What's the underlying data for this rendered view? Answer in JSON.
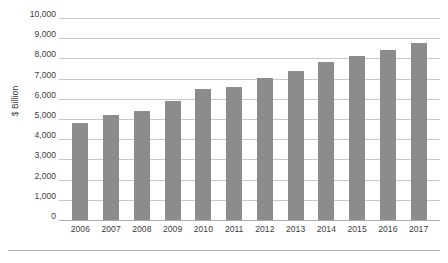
{
  "chart_data": {
    "type": "bar",
    "title": "",
    "xlabel": "",
    "ylabel": "$ Billion",
    "categories": [
      "2006",
      "2007",
      "2008",
      "2009",
      "2010",
      "2011",
      "2012",
      "2013",
      "2014",
      "2015",
      "2016",
      "2017"
    ],
    "values": [
      4800,
      5200,
      5400,
      5900,
      6500,
      6600,
      7050,
      7400,
      7800,
      8100,
      8400,
      8750
    ],
    "ylim": [
      0,
      10000
    ],
    "y_ticks": [
      0,
      1000,
      2000,
      3000,
      4000,
      5000,
      6000,
      7000,
      8000,
      9000,
      10000
    ],
    "y_tick_labels": [
      "0",
      "1,000",
      "2,000",
      "3,000",
      "4,000",
      "5,000",
      "6,000",
      "7,000",
      "8,000",
      "9,000",
      "10,000"
    ],
    "grid": true,
    "legend": false,
    "bar_color": "#8c8c8c",
    "gridline_color": "#c9c9c9",
    "axis_color": "#a8a8a8",
    "background_color": "#ffffff"
  },
  "caption": {
    "text": ""
  }
}
